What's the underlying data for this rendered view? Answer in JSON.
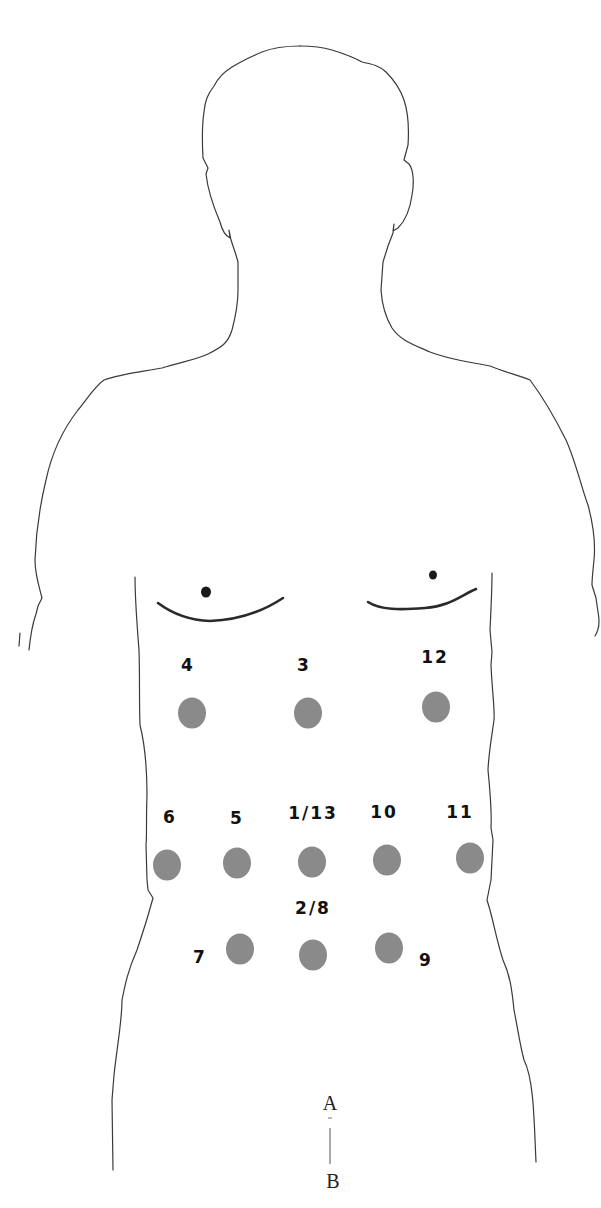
{
  "figure": {
    "type": "anterior body outline with measurement sites",
    "colors": {
      "background": "#ffffff",
      "outline": "#3a3a3a",
      "dot_fill": "#8a8a8a",
      "label": "#111111"
    }
  },
  "sites": [
    {
      "label": "4",
      "x": 192,
      "y": 713,
      "lx": 188,
      "ly": 671
    },
    {
      "label": "3",
      "x": 308,
      "y": 713,
      "lx": 304,
      "ly": 671
    },
    {
      "label": "12",
      "x": 436,
      "y": 707,
      "lx": 435,
      "ly": 663
    },
    {
      "label": "6",
      "x": 167,
      "y": 865,
      "lx": 170,
      "ly": 823
    },
    {
      "label": "5",
      "x": 237,
      "y": 863,
      "lx": 237,
      "ly": 824
    },
    {
      "label": "1/13",
      "x": 312,
      "y": 862,
      "lx": 313,
      "ly": 819
    },
    {
      "label": "10",
      "x": 387,
      "y": 860,
      "lx": 384,
      "ly": 818
    },
    {
      "label": "11",
      "x": 470,
      "y": 858,
      "lx": 460,
      "ly": 818
    },
    {
      "label": "7",
      "x": 240,
      "y": 949,
      "lx": 200,
      "ly": 963
    },
    {
      "label": "2/8",
      "x": 313,
      "y": 955,
      "lx": 313,
      "ly": 914
    },
    {
      "label": "9",
      "x": 389,
      "y": 948,
      "lx": 426,
      "ly": 966
    }
  ],
  "reference": {
    "label_a": "A",
    "label_b": "B"
  }
}
